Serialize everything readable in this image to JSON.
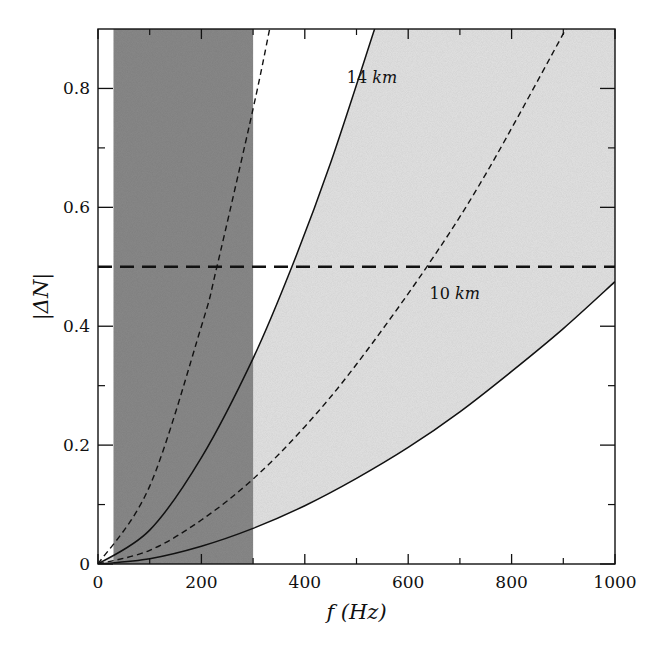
{
  "chart_data": {
    "type": "line",
    "title": "",
    "xlabel": "f (Hz)",
    "ylabel": "|ΔN|",
    "xlim": [
      0,
      1000
    ],
    "ylim": [
      0,
      0.9
    ],
    "x_ticks": [
      0,
      200,
      400,
      600,
      800,
      1000
    ],
    "x_tick_labels": [
      "0",
      "200",
      "400",
      "600",
      "800",
      "1000"
    ],
    "x_minor_ticks": [
      100,
      300,
      500,
      700,
      900
    ],
    "y_ticks": [
      0,
      0.2,
      0.4,
      0.6,
      0.8
    ],
    "y_tick_labels": [
      "0",
      "0.2",
      "0.4",
      "0.6",
      "0.8"
    ],
    "y_minor_ticks": [
      0.1,
      0.3,
      0.5,
      0.7
    ],
    "grid": false,
    "shaded_bands": [
      {
        "name": "observed frequency band",
        "x_range": [
          30,
          300
        ],
        "color": "#8a8a8a"
      }
    ],
    "filled_regions": [
      {
        "name": "region between 10 km and 14 km curves",
        "between": [
          "14 km (solid)",
          "10 km (solid)"
        ],
        "color": "#e4e4e4"
      }
    ],
    "series": [
      {
        "name": "14 km (solid)",
        "style": "solid",
        "x": [
          0,
          100,
          200,
          300,
          375,
          450,
          535
        ],
        "y": [
          0,
          0.057,
          0.179,
          0.346,
          0.5,
          0.675,
          0.9
        ]
      },
      {
        "name": "10 km (solid)",
        "style": "solid",
        "x": [
          0,
          100,
          200,
          300,
          400,
          500,
          600,
          700,
          800,
          900,
          1000
        ],
        "y": [
          0,
          0.009,
          0.03,
          0.06,
          0.098,
          0.144,
          0.196,
          0.256,
          0.324,
          0.396,
          0.475
        ]
      },
      {
        "name": "14 km (dashed)",
        "style": "dashed",
        "x": [
          0,
          100,
          200,
          230,
          300,
          332
        ],
        "y": [
          0,
          0.131,
          0.4,
          0.5,
          0.766,
          0.9
        ]
      },
      {
        "name": "10 km (dashed)",
        "style": "dashed",
        "x": [
          0,
          100,
          200,
          300,
          400,
          500,
          636,
          750,
          905
        ],
        "y": [
          0,
          0.023,
          0.074,
          0.143,
          0.231,
          0.336,
          0.5,
          0.656,
          0.9
        ]
      },
      {
        "name": "threshold",
        "style": "long-dashed",
        "x": [
          0,
          1000
        ],
        "y": [
          0.5,
          0.5
        ]
      }
    ],
    "annotations": [
      {
        "text_num": "14",
        "text_unit": "km",
        "x": 530,
        "y": 0.81
      },
      {
        "text_num": "10",
        "text_unit": "km",
        "x": 690,
        "y": 0.445
      }
    ]
  }
}
